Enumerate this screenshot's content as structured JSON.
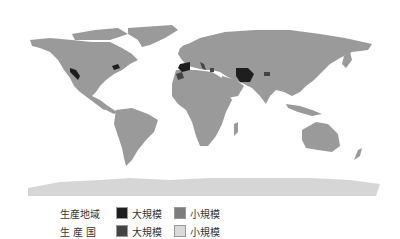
{
  "map": {
    "colors": {
      "ocean": "#ffffff",
      "land_small_country": "#9a9a9a",
      "land_large_region": "#1e1e1e",
      "land_large_country": "#444444",
      "antarctica": "#d6d6d6"
    },
    "highlighted_regions": [
      {
        "name": "California",
        "class": "large-region"
      },
      {
        "name": "Eastern US spot",
        "class": "large-region"
      },
      {
        "name": "Spain",
        "class": "large-region"
      },
      {
        "name": "Morocco",
        "class": "large-region"
      },
      {
        "name": "Italy",
        "class": "large-region"
      },
      {
        "name": "Greece",
        "class": "large-region"
      },
      {
        "name": "Iran",
        "class": "large-region"
      },
      {
        "name": "Afghanistan",
        "class": "large-region"
      }
    ]
  },
  "legend": {
    "rows": [
      {
        "title": "生産地域",
        "items": [
          {
            "label": "大規模",
            "color": "#1e1e1e"
          },
          {
            "label": "小規模",
            "color": "#7c7c7c"
          }
        ]
      },
      {
        "title": "生 産 国",
        "items": [
          {
            "label": "大規模",
            "color": "#444444"
          },
          {
            "label": "小規模",
            "color": "#d9d9d9"
          }
        ]
      }
    ]
  }
}
